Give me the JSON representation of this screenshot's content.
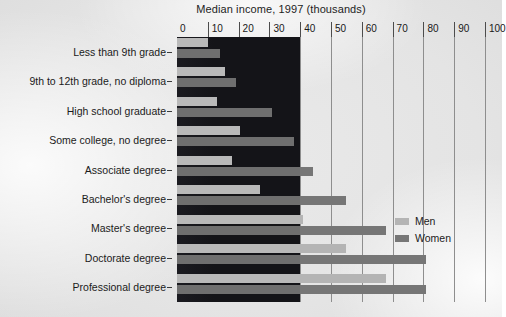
{
  "chart_data": {
    "type": "bar",
    "orientation": "horizontal",
    "title": "Median income, 1997 (thousands)",
    "xlabel": "",
    "ylabel": "",
    "xlim": [
      0,
      100
    ],
    "xticks": [
      0,
      10,
      20,
      30,
      40,
      50,
      60,
      70,
      80,
      90,
      100
    ],
    "grid": true,
    "legend_position": "right",
    "categories": [
      "Less than 9th grade",
      "9th to 12th grade, no diploma",
      "High school graduate",
      "Some college, no degree",
      "Associate degree",
      "Bachelor's degree",
      "Master's degree",
      "Doctorate degree",
      "Professional degree"
    ],
    "series": [
      {
        "name": "Men",
        "color": "#b4b4b4",
        "values": [
          10,
          15.5,
          13,
          20.5,
          18,
          27,
          41,
          55,
          68
        ]
      },
      {
        "name": "Women",
        "color": "#767676",
        "values": [
          14,
          19,
          31,
          38,
          44,
          55,
          68,
          81,
          81
        ]
      }
    ]
  },
  "chart": {
    "title": "Median income, 1997 (thousands)",
    "axis_ticks": [
      "0",
      "10",
      "20",
      "30",
      "40",
      "50",
      "60",
      "70",
      "80",
      "90",
      "100"
    ],
    "categories": [
      "Less than 9th grade",
      "9th to 12th grade, no diploma",
      "High school graduate",
      "Some college, no degree",
      "Associate degree",
      "Bachelor's degree",
      "Master's degree",
      "Doctorate degree",
      "Professional degree"
    ],
    "legend": [
      {
        "label": "Men",
        "color": "#b4b4b4"
      },
      {
        "label": "Women",
        "color": "#767676"
      }
    ]
  }
}
